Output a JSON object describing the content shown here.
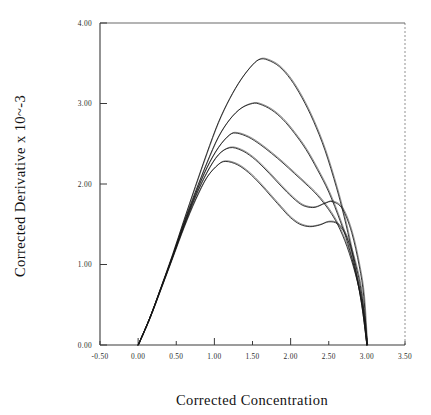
{
  "figure": {
    "background_color": "#ffffff",
    "line_color": "#151515",
    "axis_color": "#3a3a3a"
  },
  "chart_data": {
    "type": "line",
    "title": "",
    "subtitle": "",
    "xlabel": "Corrected Concentration",
    "ylabel": "Corrected Derivative x 10^-3",
    "ylabel_display": "Corrected Derivative x 10~-3",
    "xlim": [
      -0.5,
      3.5
    ],
    "ylim": [
      0.0,
      4.0
    ],
    "xticks": [
      -0.5,
      0.0,
      0.5,
      1.0,
      1.5,
      2.0,
      2.5,
      3.0,
      3.5
    ],
    "xtick_labels": [
      "-0.50",
      "0.00",
      "0.50",
      "1.00",
      "1.50",
      "2.00",
      "2.50",
      "3.00",
      "3.50"
    ],
    "yticks": [
      0.0,
      1.0,
      2.0,
      3.0,
      4.0
    ],
    "ytick_labels": [
      "0.00",
      "1.00",
      "2.00",
      "3.00",
      "4.00"
    ],
    "grid": false,
    "legend": "none",
    "series_count": 5,
    "series": [
      {
        "name": "curve-1",
        "peak_x": 1.6,
        "peak_y": 3.55,
        "x": [
          0.0,
          0.15,
          0.3,
          0.45,
          0.6,
          0.75,
          0.9,
          1.05,
          1.2,
          1.35,
          1.5,
          1.6,
          1.7,
          1.85,
          2.0,
          2.15,
          2.3,
          2.45,
          2.6,
          2.7,
          2.8,
          2.9,
          2.95,
          3.0
        ],
        "y": [
          0.0,
          0.33,
          0.72,
          1.12,
          1.55,
          1.97,
          2.38,
          2.76,
          3.06,
          3.3,
          3.48,
          3.55,
          3.54,
          3.46,
          3.3,
          3.07,
          2.78,
          2.42,
          1.96,
          1.6,
          1.18,
          0.68,
          0.38,
          0.0
        ]
      },
      {
        "name": "curve-2",
        "peak_x": 1.5,
        "peak_y": 3.0,
        "x": [
          0.0,
          0.15,
          0.3,
          0.45,
          0.6,
          0.75,
          0.9,
          1.05,
          1.2,
          1.35,
          1.5,
          1.6,
          1.75,
          1.9,
          2.05,
          2.2,
          2.35,
          2.5,
          2.65,
          2.75,
          2.85,
          2.93,
          3.0
        ],
        "y": [
          0.0,
          0.33,
          0.71,
          1.1,
          1.52,
          1.9,
          2.26,
          2.58,
          2.8,
          2.94,
          3.0,
          2.99,
          2.92,
          2.8,
          2.63,
          2.43,
          2.18,
          1.9,
          1.54,
          1.26,
          0.9,
          0.52,
          0.0
        ]
      },
      {
        "name": "curve-3",
        "peak_x": 1.25,
        "peak_y": 2.63,
        "x": [
          0.0,
          0.15,
          0.3,
          0.45,
          0.6,
          0.75,
          0.9,
          1.05,
          1.2,
          1.3,
          1.45,
          1.6,
          1.75,
          1.9,
          2.05,
          2.2,
          2.35,
          2.5,
          2.62,
          2.74,
          2.85,
          2.94,
          3.0
        ],
        "y": [
          0.0,
          0.33,
          0.71,
          1.1,
          1.5,
          1.87,
          2.2,
          2.45,
          2.61,
          2.63,
          2.58,
          2.49,
          2.38,
          2.26,
          2.13,
          2.0,
          1.86,
          1.68,
          1.49,
          1.22,
          0.88,
          0.5,
          0.0
        ]
      },
      {
        "name": "curve-4",
        "peak_x": 1.2,
        "peak_y": 2.45,
        "shoulder": true,
        "x": [
          0.0,
          0.15,
          0.3,
          0.45,
          0.6,
          0.75,
          0.9,
          1.05,
          1.2,
          1.35,
          1.5,
          1.65,
          1.8,
          1.95,
          2.1,
          2.2,
          2.32,
          2.45,
          2.55,
          2.68,
          2.8,
          2.9,
          2.96,
          3.0
        ],
        "y": [
          0.0,
          0.33,
          0.71,
          1.09,
          1.48,
          1.84,
          2.14,
          2.36,
          2.45,
          2.42,
          2.33,
          2.2,
          2.05,
          1.9,
          1.77,
          1.72,
          1.71,
          1.76,
          1.78,
          1.69,
          1.4,
          0.98,
          0.6,
          0.0
        ]
      },
      {
        "name": "curve-5",
        "peak_x": 1.15,
        "peak_y": 2.28,
        "shoulder": true,
        "x": [
          0.0,
          0.15,
          0.3,
          0.45,
          0.6,
          0.75,
          0.9,
          1.05,
          1.15,
          1.3,
          1.45,
          1.6,
          1.75,
          1.9,
          2.0,
          2.12,
          2.25,
          2.38,
          2.5,
          2.62,
          2.74,
          2.86,
          2.94,
          3.0
        ],
        "y": [
          0.0,
          0.33,
          0.7,
          1.08,
          1.46,
          1.8,
          2.08,
          2.24,
          2.28,
          2.24,
          2.14,
          2.0,
          1.84,
          1.68,
          1.58,
          1.5,
          1.47,
          1.49,
          1.53,
          1.5,
          1.33,
          0.97,
          0.58,
          0.0
        ]
      }
    ]
  }
}
